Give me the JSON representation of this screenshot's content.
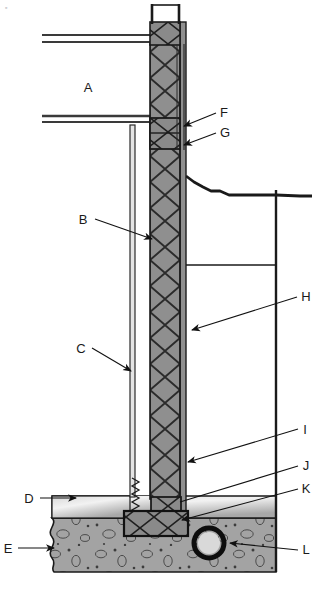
{
  "figure": {
    "type": "architectural-section",
    "corner_mark": "▫",
    "background_color": "#ffffff",
    "line_color": "#1a1a1a",
    "wall_fill_color": "#8c8c8c",
    "soil_fill_color": "#9e9e9e",
    "slab_fill_color": "#b5b5b5",
    "footing_fill_color": "#8a8a8a"
  },
  "callouts": [
    {
      "key": "A",
      "label": "A",
      "label_x": 90,
      "label_y": 92,
      "has_leader": false,
      "has_arrow": false
    },
    {
      "key": "B",
      "label": "B",
      "label_x": 82,
      "label_y": 223,
      "has_leader": true,
      "has_arrow": true,
      "leader": {
        "x1": 92,
        "y1": 219,
        "x2": 152,
        "y2": 238
      }
    },
    {
      "key": "C",
      "label": "C",
      "label_x": 80,
      "label_y": 352,
      "has_leader": true,
      "has_arrow": true,
      "leader": {
        "x1": 90,
        "y1": 348,
        "x2": 133,
        "y2": 369
      }
    },
    {
      "key": "D",
      "label": "D",
      "label_x": 28,
      "label_y": 503,
      "has_leader": true,
      "has_arrow": true,
      "leader": {
        "x1": 40,
        "y1": 499,
        "x2": 74,
        "y2": 499
      }
    },
    {
      "key": "E",
      "label": "E",
      "label_x": 6,
      "label_y": 552,
      "has_leader": true,
      "has_arrow": true,
      "leader": {
        "x1": 18,
        "y1": 548,
        "x2": 52,
        "y2": 548
      }
    },
    {
      "key": "F",
      "label": "F",
      "label_x": 221,
      "label_y": 117,
      "has_leader": true,
      "has_arrow": true,
      "leader": {
        "x1": 218,
        "y1": 114,
        "x2": 182,
        "y2": 126
      }
    },
    {
      "key": "G",
      "label": "G",
      "label_x": 221,
      "label_y": 137,
      "has_leader": true,
      "has_arrow": true,
      "leader": {
        "x1": 218,
        "y1": 134,
        "x2": 182,
        "y2": 144
      }
    },
    {
      "key": "H",
      "label": "H",
      "label_x": 302,
      "label_y": 300,
      "has_leader": true,
      "has_arrow": true,
      "leader": {
        "x1": 299,
        "y1": 297,
        "x2": 190,
        "y2": 330
      }
    },
    {
      "key": "I",
      "label": "I",
      "label_x": 303,
      "label_y": 433,
      "has_leader": true,
      "has_arrow": true,
      "leader": {
        "x1": 300,
        "y1": 430,
        "x2": 186,
        "y2": 462
      }
    },
    {
      "key": "J",
      "label": "J",
      "label_x": 303,
      "label_y": 469,
      "has_leader": true,
      "has_arrow": false,
      "leader": {
        "x1": 300,
        "y1": 466,
        "x2": 178,
        "y2": 500
      }
    },
    {
      "key": "K",
      "label": "K",
      "label_x": 303,
      "label_y": 492,
      "has_leader": true,
      "has_arrow": true,
      "leader": {
        "x1": 300,
        "y1": 489,
        "x2": 180,
        "y2": 519
      }
    },
    {
      "key": "L",
      "label": "L",
      "label_x": 303,
      "label_y": 553,
      "has_leader": true,
      "has_arrow": true,
      "leader": {
        "x1": 300,
        "y1": 550,
        "x2": 228,
        "y2": 543
      }
    }
  ],
  "geometry": {
    "wall": {
      "x": 150,
      "y": 22,
      "width": 30,
      "height": 488
    },
    "inner_membrane": {
      "x": 130,
      "y": 125,
      "width": 4,
      "height": 385
    },
    "outer_skin": {
      "x": 180,
      "y": 22,
      "width": 6,
      "height": 488
    },
    "band_joist": {
      "x": 150,
      "y": 118,
      "width": 30,
      "height": 30
    },
    "top_plate": {
      "x": 150,
      "y": 22,
      "width": 30,
      "height": 22
    },
    "sill_plate": {
      "x": 152,
      "y": 497,
      "width": 28,
      "height": 22
    },
    "footing": {
      "x": 124,
      "y": 511,
      "width": 64,
      "height": 24
    },
    "upper_floor_line": {
      "x1": 42,
      "y1": 38,
      "x2": 152,
      "y2": 38
    },
    "lower_floor_line": {
      "x1": 42,
      "y1": 119,
      "x2": 152,
      "y2": 119
    },
    "excavation_right_wall": {
      "x": 276,
      "y": 190,
      "height": 382
    },
    "basement_floor_line": {
      "x1": 186,
      "y1": 265,
      "x2": 276,
      "y2": 265
    },
    "slab_top_y": 496,
    "soil_top_y": 518,
    "soil_bottom_y": 572,
    "drain_pipe": {
      "cx": 209,
      "cy": 543,
      "r": 13,
      "ring_width": 4
    },
    "grade_line_points": "186,178 196,183 206,188 214,192 222,192 232,196 240,196 248,196 262,196 276,196 296,196 306,196"
  }
}
